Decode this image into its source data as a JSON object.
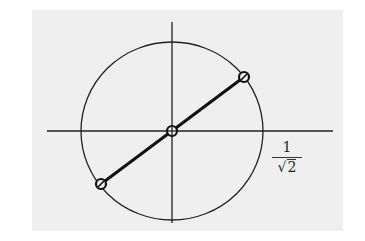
{
  "figure": {
    "background_color": "#efefef",
    "stroke_color": "#222222",
    "axes": {
      "horizontal": {
        "x1": 47,
        "y": 131,
        "x2": 333
      },
      "vertical": {
        "x": 172,
        "y1": 22,
        "y2": 223
      }
    },
    "circle": {
      "cx": 172,
      "cy": 131,
      "rx": 91,
      "ry": 89
    },
    "segment": {
      "x1": 101,
      "y1": 184,
      "x2": 244,
      "y2": 77
    },
    "points": [
      {
        "name": "origin",
        "cx": 172,
        "cy": 131
      },
      {
        "name": "upper-right",
        "cx": 244,
        "cy": 77
      },
      {
        "name": "lower-left",
        "cx": 101,
        "cy": 184
      }
    ],
    "label": {
      "numerator": "1",
      "radical": "√",
      "radicand": "2"
    }
  }
}
